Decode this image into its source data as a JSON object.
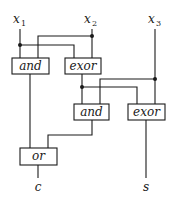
{
  "diagram": {
    "type": "logic-circuit",
    "inputs": [
      {
        "name": "x",
        "sub": "1"
      },
      {
        "name": "x",
        "sub": "2"
      },
      {
        "name": "x",
        "sub": "3"
      }
    ],
    "gates": [
      {
        "id": "and1",
        "label": "and"
      },
      {
        "id": "exor1",
        "label": "exor"
      },
      {
        "id": "and2",
        "label": "and"
      },
      {
        "id": "exor2",
        "label": "exor"
      },
      {
        "id": "or1",
        "label": "or"
      }
    ],
    "outputs": [
      {
        "name": "c"
      },
      {
        "name": "s"
      }
    ],
    "connections": [
      [
        "x1",
        "and1"
      ],
      [
        "x1",
        "exor1"
      ],
      [
        "x2",
        "and1"
      ],
      [
        "x2",
        "exor1"
      ],
      [
        "exor1",
        "and2"
      ],
      [
        "exor1",
        "exor2"
      ],
      [
        "x3",
        "and2"
      ],
      [
        "x3",
        "exor2"
      ],
      [
        "and1",
        "or1"
      ],
      [
        "and2",
        "or1"
      ],
      [
        "or1",
        "c"
      ],
      [
        "exor2",
        "s"
      ]
    ]
  }
}
